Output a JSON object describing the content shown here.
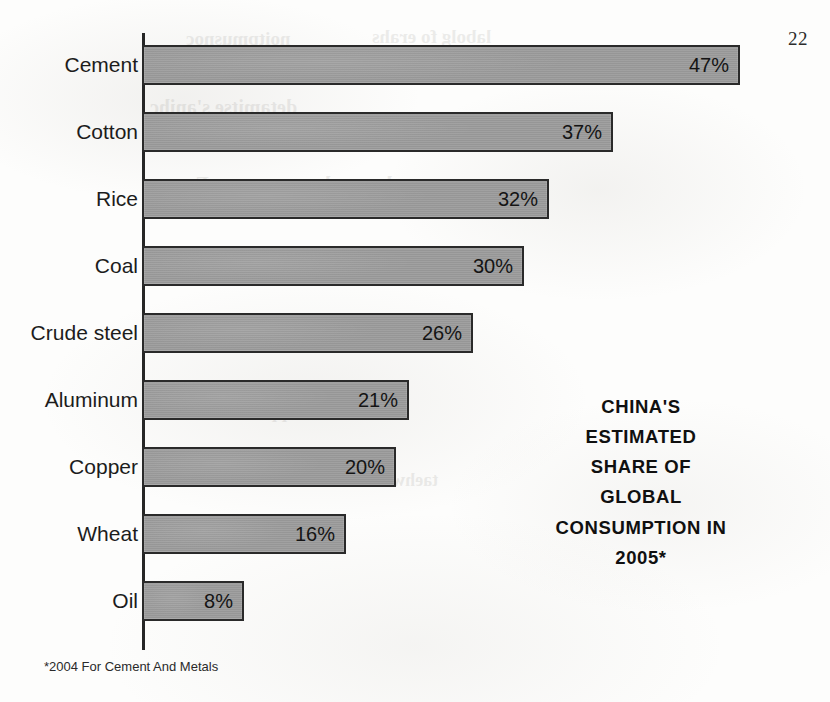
{
  "page": {
    "number": "22",
    "footnote": "*2004 For Cement And Metals"
  },
  "caption": {
    "lines": [
      "CHINA'S",
      "ESTIMATED",
      "SHARE OF",
      "GLOBAL",
      "CONSUMPTION IN",
      "2005*"
    ]
  },
  "style": {
    "bar_fill": "#9b9b9b",
    "bar_stroke": "#2a2a2a",
    "axis_color": "#262626",
    "text_color": "#1c1c1c",
    "paper": "#fdfdfc"
  },
  "bleed_through": [
    {
      "text": "noitpmusnoc",
      "left": 186,
      "top": 28,
      "size": 19
    },
    {
      "text": "labolg fo erahs",
      "left": 372,
      "top": 26,
      "size": 19
    },
    {
      "text": "detamitse s'anihc",
      "left": 150,
      "top": 96,
      "size": 20
    },
    {
      "text": "slatem dna tnemec roF",
      "left": 196,
      "top": 172,
      "size": 21
    },
    {
      "text": "muinimula reppoc",
      "left": 250,
      "top": 402,
      "size": 18
    },
    {
      "text": "taehw ecir lio laoc",
      "left": 300,
      "top": 470,
      "size": 18
    }
  ],
  "chart_data": {
    "type": "bar",
    "orientation": "horizontal",
    "xlabel": "",
    "ylabel": "",
    "xlim": [
      0,
      47
    ],
    "grid": false,
    "legend": "none",
    "units": "percent",
    "value_label_position": "inside-end",
    "note": "*2004 For Cement And Metals",
    "categories": [
      "Cement",
      "Cotton",
      "Rice",
      "Coal",
      "Crude steel",
      "Aluminum",
      "Copper",
      "Wheat",
      "Oil"
    ],
    "values": [
      47,
      37,
      32,
      30,
      26,
      21,
      20,
      16,
      8
    ],
    "value_labels": [
      "47%",
      "37%",
      "32%",
      "30%",
      "26%",
      "21%",
      "20%",
      "16%",
      "8%"
    ]
  },
  "layout": {
    "axis_x": 142,
    "plot_top": 45,
    "row_pitch": 67,
    "bar_height": 40,
    "px_per_percent": 12.72
  }
}
